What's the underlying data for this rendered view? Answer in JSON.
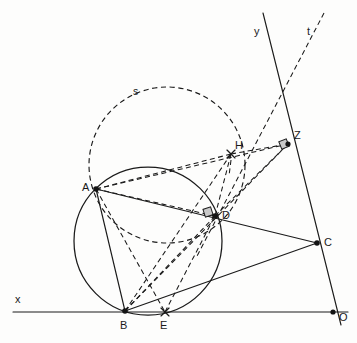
{
  "figure": {
    "width": 357,
    "height": 343,
    "background_color": "#fdfdfc",
    "stroke_color": "#1a1a1a"
  },
  "points": [
    {
      "id": "A",
      "label": "A",
      "x": 96,
      "y": 189,
      "label_x": 82,
      "label_y": 182,
      "marker": "dot"
    },
    {
      "id": "B",
      "label": "B",
      "x": 125,
      "y": 311,
      "label_x": 120,
      "label_y": 320,
      "marker": "dot"
    },
    {
      "id": "C",
      "label": "C",
      "x": 317,
      "y": 243,
      "label_x": 324,
      "label_y": 237,
      "marker": "dot"
    },
    {
      "id": "D",
      "label": "D",
      "x": 215,
      "y": 216,
      "label_x": 222,
      "label_y": 210,
      "marker": "dot"
    },
    {
      "id": "E",
      "label": "E",
      "x": 165,
      "y": 312,
      "label_x": 160,
      "label_y": 320,
      "marker": "cross"
    },
    {
      "id": "H",
      "label": "H",
      "x": 231,
      "y": 154,
      "label_x": 235,
      "label_y": 140,
      "marker": "cross"
    },
    {
      "id": "Z",
      "label": "Z",
      "x": 288,
      "y": 144,
      "label_x": 294,
      "label_y": 130,
      "marker": "dot"
    },
    {
      "id": "O",
      "label": "O",
      "x": 333,
      "y": 312,
      "label_x": 339,
      "label_y": 315,
      "marker": "dot"
    }
  ],
  "axes": [
    {
      "id": "x-axis",
      "label": "x",
      "label_x": 17,
      "label_y": 296,
      "x1": 13,
      "y1": 312,
      "x2": 348,
      "y2": 312,
      "style": "solid"
    },
    {
      "id": "y-axis",
      "label": "y",
      "label_x": 255,
      "label_y": 28,
      "x1": 263,
      "y1": 13,
      "x2": 341,
      "y2": 325,
      "style": "solid"
    },
    {
      "id": "t-line",
      "label": "t",
      "label_x": 308,
      "label_y": 28,
      "x1": 324,
      "y1": 13,
      "x2": 196,
      "y2": 258,
      "style": "dashed"
    }
  ],
  "circles": [
    {
      "id": "main-circle",
      "label": "",
      "cx": 148,
      "cy": 241,
      "r": 74,
      "style": "solid"
    },
    {
      "id": "circle-s",
      "label": "s",
      "cx": 167,
      "cy": 165,
      "r": 78,
      "style": "dashed",
      "label_x": 134,
      "label_y": 87
    }
  ],
  "solid_segments": [
    {
      "id": "segment-AC",
      "from": "A",
      "to": "C"
    },
    {
      "id": "segment-AB",
      "from": "A",
      "to": "B"
    },
    {
      "id": "segment-BC",
      "from": "B",
      "to": "C"
    }
  ],
  "dashed_segments": [
    {
      "id": "segment-AH",
      "from": "A",
      "to": "H"
    },
    {
      "id": "segment-AZ",
      "from": "A",
      "to": "Z"
    },
    {
      "id": "segment-AD",
      "from": "A",
      "to": "D"
    },
    {
      "id": "segment-AE",
      "from": "A",
      "to": "E"
    },
    {
      "id": "segment-BD",
      "from": "B",
      "to": "D"
    },
    {
      "id": "segment-BH",
      "from": "B",
      "to": "H"
    },
    {
      "id": "segment-BZ",
      "from": "B",
      "to": "Z"
    },
    {
      "id": "segment-DE",
      "from": "D",
      "to": "E"
    },
    {
      "id": "segment-DZ",
      "from": "D",
      "to": "Z"
    },
    {
      "id": "segment-ED",
      "from": "E",
      "to": "D"
    },
    {
      "id": "segment-HD",
      "from": "H",
      "to": "D"
    },
    {
      "id": "segment-HZ",
      "from": "H",
      "to": "Z"
    }
  ],
  "right_angle_marks": [
    {
      "id": "right-angle-at-D",
      "x": 207,
      "y": 211,
      "size": 8,
      "rotation": -18
    },
    {
      "id": "right-angle-at-Z",
      "x": 283,
      "y": 143,
      "size": 8,
      "rotation": -22
    }
  ],
  "tick_segment": {
    "id": "perpendicular-tick-at-H",
    "x1": 231,
    "y1": 160,
    "x2": 229,
    "y2": 176
  }
}
